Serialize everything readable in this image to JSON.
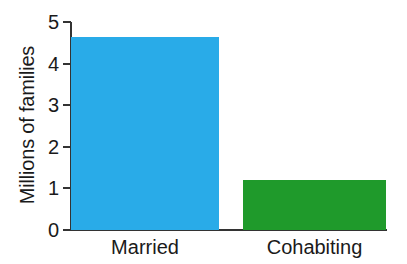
{
  "chart_data": {
    "type": "bar",
    "title": "",
    "subtitle": "",
    "xlabel": "",
    "ylabel": "Millions of families",
    "categories": [
      "Married",
      "Cohabiting"
    ],
    "values": [
      4.65,
      1.2
    ],
    "series": [
      {
        "name": "Millions of families",
        "values": [
          4.65,
          1.2
        ]
      }
    ],
    "bar_colors": [
      "#29ABE8",
      "#1F9A2B"
    ],
    "ylim": [
      0,
      5
    ],
    "ytick_labels": [
      "0",
      "1",
      "2",
      "3",
      "4",
      "5"
    ],
    "ytick_values": [
      0,
      1,
      2,
      3,
      4,
      5
    ],
    "grid": false,
    "legend": false,
    "legend_position": "none",
    "annotations": []
  },
  "axis": {
    "y_title": "Millions of families",
    "ticks": [
      {
        "label": "5",
        "value": 5
      },
      {
        "label": "4",
        "value": 4
      },
      {
        "label": "3",
        "value": 3
      },
      {
        "label": "2",
        "value": 2
      },
      {
        "label": "1",
        "value": 1
      },
      {
        "label": "0",
        "value": 0
      }
    ]
  },
  "bars": [
    {
      "label": "Married",
      "value": 4.65,
      "color": "#29ABE8"
    },
    {
      "label": "Cohabiting",
      "value": 1.2,
      "color": "#1F9A2B"
    }
  ],
  "colors": {
    "axis": "#333333",
    "text": "#1a1a1a",
    "background": "#ffffff",
    "married_bar": "#29ABE8",
    "cohabiting_bar": "#1F9A2B"
  }
}
